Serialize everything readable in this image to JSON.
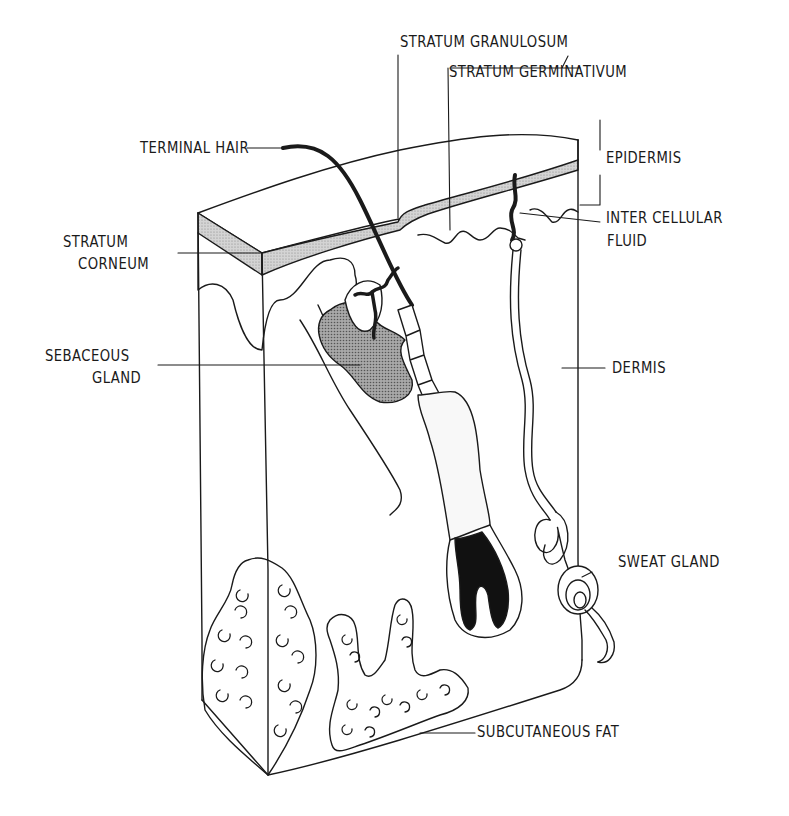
{
  "diagram": {
    "type": "anatomical-illustration",
    "colors": {
      "ink": "#1a1a1a",
      "shade": "#c8c8c8",
      "dark_shade": "#9a9a9a",
      "background": "#ffffff"
    }
  },
  "labels": {
    "stratum_granulosum": "STRATUM GRANULOSUM",
    "stratum_germinativum": "STRATUM GERMINATIVUM",
    "terminal_hair": "TERMINAL HAIR",
    "epidermis": "EPIDERMIS",
    "stratum_corneum_1": "STRATUM",
    "stratum_corneum_2": "CORNEUM",
    "intercellular_fluid_1": "INTER CELLULAR",
    "intercellular_fluid_2": "FLUID",
    "sebaceous_gland_1": "SEBACEOUS",
    "sebaceous_gland_2": "GLAND",
    "dermis": "DERMIS",
    "sweat_gland": "SWEAT GLAND",
    "subcutaneous_fat": "SUBCUTANEOUS FAT"
  }
}
